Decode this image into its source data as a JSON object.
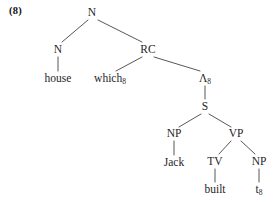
{
  "figure": {
    "example_number": "(8)",
    "background_color": "#ffffff",
    "line_color": "#444444",
    "text_color": "#1f1f1f"
  },
  "tree": {
    "description": "Syntactic phrase structure tree for a relative clause: house which8 Jack built t8",
    "nodes": {
      "root_n": {
        "label": "N",
        "type": "category",
        "x": 92,
        "y": 13
      },
      "left_n": {
        "label": "N",
        "type": "category",
        "x": 58,
        "y": 50
      },
      "house": {
        "label": "house",
        "type": "lexical",
        "x": 58,
        "y": 79
      },
      "rc": {
        "label": "RC",
        "type": "category",
        "x": 148,
        "y": 50
      },
      "which": {
        "label": "which",
        "subscript": "8",
        "type": "lexical",
        "x": 110,
        "y": 79
      },
      "lambda": {
        "label": "Λ",
        "subscript": "8",
        "type": "category",
        "x": 205,
        "y": 79
      },
      "s": {
        "label": "S",
        "type": "category",
        "x": 205,
        "y": 107
      },
      "np_subject": {
        "label": "NP",
        "type": "category",
        "x": 174,
        "y": 134
      },
      "jack": {
        "label": "Jack",
        "type": "lexical",
        "x": 174,
        "y": 163
      },
      "vp": {
        "label": "VP",
        "type": "category",
        "x": 236,
        "y": 134
      },
      "tv": {
        "label": "TV",
        "type": "category",
        "x": 215,
        "y": 162
      },
      "built": {
        "label": "built",
        "type": "lexical",
        "x": 215,
        "y": 190
      },
      "np_object": {
        "label": "NP",
        "type": "category",
        "x": 259,
        "y": 162
      },
      "trace": {
        "label": "t",
        "subscript": "8",
        "type": "lexical",
        "x": 259,
        "y": 190
      }
    },
    "edges": [
      {
        "name": "root-to-left-n",
        "from": [
          88,
          20
        ],
        "to": [
          62,
          42
        ]
      },
      {
        "name": "root-to-rc",
        "from": [
          98,
          20
        ],
        "to": [
          142,
          42
        ]
      },
      {
        "name": "left-n-to-house",
        "from": [
          58,
          57
        ],
        "to": [
          58,
          71
        ]
      },
      {
        "name": "rc-to-which",
        "from": [
          142,
          57
        ],
        "to": [
          116,
          71
        ]
      },
      {
        "name": "rc-to-lambda",
        "from": [
          154,
          57
        ],
        "to": [
          200,
          71
        ]
      },
      {
        "name": "lambda-to-s",
        "from": [
          205,
          86
        ],
        "to": [
          205,
          99
        ]
      },
      {
        "name": "s-to-np-subject",
        "from": [
          201,
          114
        ],
        "to": [
          179,
          127
        ]
      },
      {
        "name": "s-to-vp",
        "from": [
          209,
          114
        ],
        "to": [
          231,
          127
        ]
      },
      {
        "name": "np-subject-to-jack",
        "from": [
          174,
          141
        ],
        "to": [
          174,
          155
        ]
      },
      {
        "name": "vp-to-tv",
        "from": [
          231,
          141
        ],
        "to": [
          219,
          154
        ]
      },
      {
        "name": "vp-to-np-object",
        "from": [
          241,
          141
        ],
        "to": [
          255,
          154
        ]
      },
      {
        "name": "tv-to-built",
        "from": [
          215,
          169
        ],
        "to": [
          215,
          182
        ]
      },
      {
        "name": "np-object-to-trace",
        "from": [
          259,
          169
        ],
        "to": [
          259,
          182
        ]
      }
    ]
  }
}
